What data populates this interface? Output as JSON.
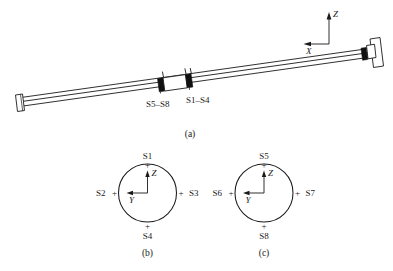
{
  "figure": {
    "title_present": false,
    "panels": [
      {
        "id": "a",
        "caption": "(a)",
        "description": "beam-elevation-view"
      },
      {
        "id": "b",
        "caption": "(b)",
        "description": "cross-section-station-1"
      },
      {
        "id": "c",
        "caption": "(c)",
        "description": "cross-section-station-2"
      }
    ]
  },
  "panel_a": {
    "caption": "(a)",
    "axes": {
      "vertical_label": "Z",
      "horizontal_label": "X"
    },
    "station_labels": [
      {
        "name": "station-label-left",
        "text": "S5–S8"
      },
      {
        "name": "station-label-right",
        "text": "S1–S4"
      }
    ]
  },
  "panel_b": {
    "caption": "(b)",
    "axes": {
      "vertical_label": "Z",
      "horizontal_label": "Y"
    },
    "sensors": [
      {
        "position": "top",
        "label": "S1",
        "marker": "+"
      },
      {
        "position": "left",
        "label": "S2",
        "marker": "+"
      },
      {
        "position": "right",
        "label": "S3",
        "marker": "+"
      },
      {
        "position": "bottom",
        "label": "S4",
        "marker": "+"
      }
    ]
  },
  "panel_c": {
    "caption": "(c)",
    "axes": {
      "vertical_label": "Z",
      "horizontal_label": "Y"
    },
    "sensors": [
      {
        "position": "top",
        "label": "S5",
        "marker": "+"
      },
      {
        "position": "left",
        "label": "S6",
        "marker": "+"
      },
      {
        "position": "right",
        "label": "S7",
        "marker": "+"
      },
      {
        "position": "bottom",
        "label": "S8",
        "marker": "+"
      }
    ]
  },
  "colors": {
    "line": "#1a1a1a",
    "fill_dark": "#111111",
    "fill_light": "#ffffff",
    "background": "#ffffff"
  }
}
